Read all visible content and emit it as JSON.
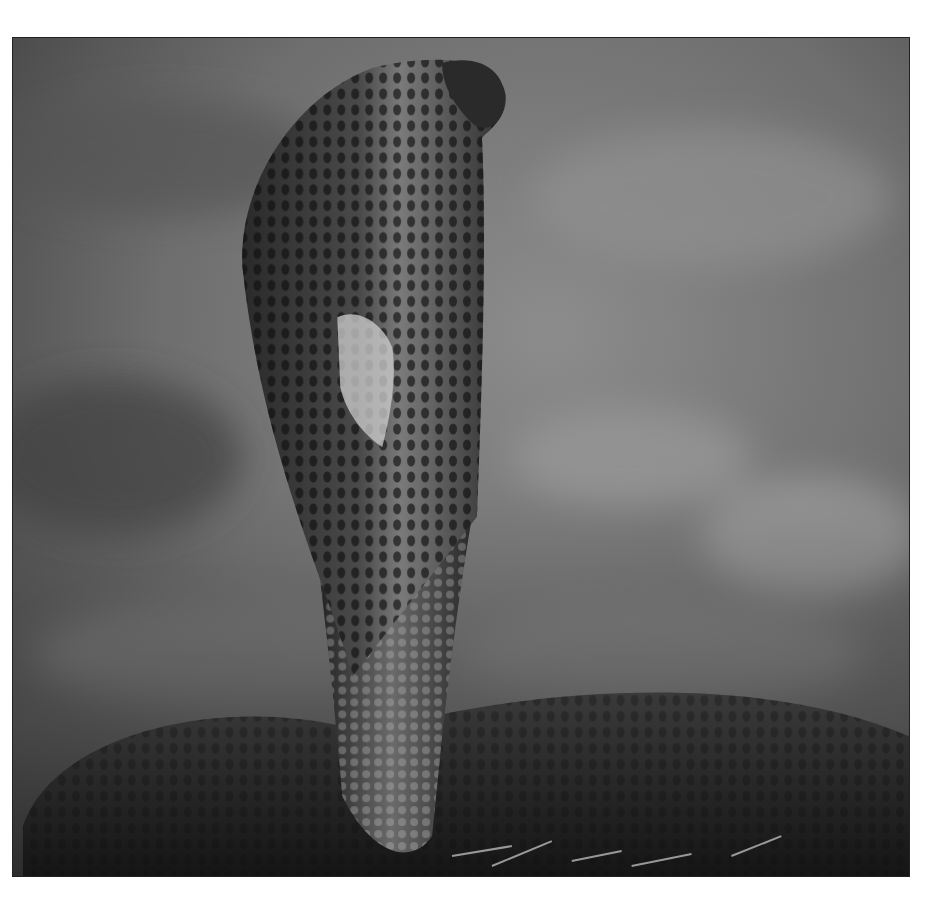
{
  "image": {
    "subject": "cobra",
    "description": "Black-and-white photograph of a cobra with hood raised, seen from behind/side, body coiled on the ground against a blurred background",
    "style": "grayscale",
    "colors": {
      "page_background": "#ffffff",
      "frame_border": "#222222",
      "background_blur_light": "#8a8a8a",
      "background_blur_dark": "#4a4a4a",
      "snake_dark": "#1a1a1a",
      "snake_mid": "#5a5a5a",
      "scale_highlight": "#c8c8c8"
    }
  }
}
